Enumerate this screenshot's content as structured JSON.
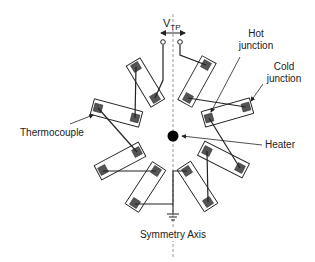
{
  "diagram": {
    "type": "thermopile-layout",
    "labels": {
      "voltage": "V",
      "voltage_sub": "TP",
      "hot_junction_line1": "Hot",
      "hot_junction_line2": "junction",
      "cold_junction_line1": "Cold",
      "cold_junction_line2": "junction",
      "thermocouple": "Thermocouple",
      "heater": "Heater",
      "symmetry_axis": "Symmetry Axis"
    },
    "colors": {
      "line": "#222222",
      "junction_fill": "#555555",
      "heater": "#000000",
      "axis": "#999999"
    },
    "thermocouple_count": 8,
    "thermocouples": [
      {
        "id": 1,
        "a": [
          136,
          67
        ],
        "b": [
          155,
          98
        ]
      },
      {
        "id": 2,
        "a": [
          98,
          108
        ],
        "b": [
          135,
          118
        ]
      },
      {
        "id": 3,
        "a": [
          103,
          170
        ],
        "b": [
          137,
          152
        ]
      },
      {
        "id": 4,
        "a": [
          156,
          171
        ],
        "b": [
          135,
          203
        ]
      },
      {
        "id": 5,
        "a": [
          187,
          171
        ],
        "b": [
          208,
          202
        ]
      },
      {
        "id": 6,
        "a": [
          207,
          151
        ],
        "b": [
          240,
          168
        ]
      },
      {
        "id": 7,
        "a": [
          209,
          118
        ],
        "b": [
          246,
          107
        ]
      },
      {
        "id": 8,
        "a": [
          206,
          65
        ],
        "b": [
          188,
          98
        ]
      }
    ]
  }
}
